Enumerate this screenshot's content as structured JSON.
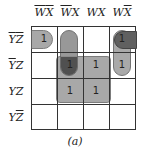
{
  "kmap": {
    "columns": [
      {
        "label_main": "W",
        "w_bar": true,
        "x_bar": true
      },
      {
        "label_main": "W",
        "w_bar": true,
        "x_bar": false
      },
      {
        "label_main": "W",
        "w_bar": false,
        "x_bar": false
      },
      {
        "label_main": "W",
        "w_bar": false,
        "x_bar": true
      }
    ],
    "col_text": [
      [
        "W",
        "X"
      ],
      [
        "W",
        "X"
      ],
      [
        "W",
        "X"
      ],
      [
        "W",
        "X"
      ]
    ],
    "row_text": [
      [
        "Y",
        "Z"
      ],
      [
        "Y",
        "Z"
      ],
      [
        "Y",
        "Z"
      ],
      [
        "Y",
        "Z"
      ]
    ],
    "row_bars": [
      [
        true,
        true
      ],
      [
        true,
        false
      ],
      [
        false,
        false
      ],
      [
        false,
        true
      ]
    ],
    "cells": [
      [
        "1",
        "",
        "",
        "1"
      ],
      [
        "",
        "1",
        "1",
        "1"
      ],
      [
        "",
        "1",
        "1",
        ""
      ],
      [
        "",
        "",
        "",
        ""
      ]
    ],
    "groupings": [
      {
        "name": "row0-wrap-cells",
        "cells": [
          [
            0,
            0
          ],
          [
            0,
            3
          ]
        ],
        "wraps": true
      },
      {
        "name": "col1-vertical-pair",
        "cells": [
          [
            0,
            1
          ],
          [
            1,
            1
          ]
        ]
      },
      {
        "name": "center-quad",
        "cells": [
          [
            1,
            1
          ],
          [
            1,
            2
          ],
          [
            2,
            1
          ],
          [
            2,
            2
          ]
        ]
      },
      {
        "name": "col3-vertical-pair",
        "cells": [
          [
            0,
            3
          ],
          [
            1,
            3
          ]
        ]
      }
    ],
    "caption": "(a)"
  },
  "colors": {
    "loop_light": "#9a9a9a",
    "loop_overlap": "#555555",
    "grid_line": "#333333"
  }
}
